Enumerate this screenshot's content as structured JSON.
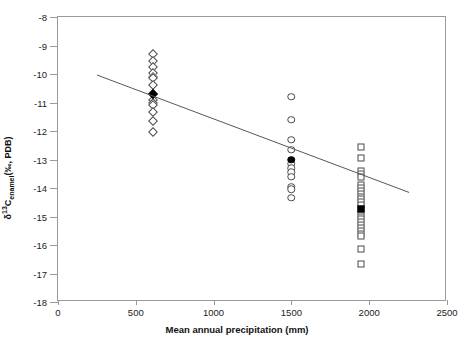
{
  "chart_data": {
    "type": "scatter",
    "title": "",
    "xlabel": "Mean annual precipitation (mm)",
    "ylabel": "d13C_enamel (per mil, PDB)",
    "ylabel_parts": {
      "delta": "δ",
      "sup": "13",
      "c": "C",
      "sub": "enamel",
      "units": "(‰, PDB)"
    },
    "xlim": [
      0,
      2500
    ],
    "ylim": [
      -18,
      -8
    ],
    "xticks": [
      0,
      500,
      1000,
      1500,
      2000,
      2500
    ],
    "yticks": [
      -8,
      -9,
      -10,
      -11,
      -12,
      -13,
      -14,
      -15,
      -16,
      -17,
      -18
    ],
    "xticklabels": [
      "0",
      "500",
      "1000",
      "1500",
      "2000",
      "2500"
    ],
    "yticklabels": [
      "-8",
      "-9",
      "-10",
      "-11",
      "-12",
      "-13",
      "-14",
      "-15",
      "-16",
      "-17",
      "-18"
    ],
    "grid": false,
    "legend": "none",
    "series": [
      {
        "name": "site-600mm",
        "marker": "diamond",
        "x": 610,
        "values": [
          -9.3,
          -9.55,
          -9.75,
          -9.95,
          -10.1,
          -10.15,
          -10.4,
          -10.9,
          -11.0,
          -11.1,
          -11.35,
          -11.65,
          -12.05
        ],
        "mean_marker": {
          "x": 610,
          "y": -10.7,
          "filled": true
        }
      },
      {
        "name": "site-1500mm",
        "marker": "circle",
        "x": 1500,
        "values": [
          -10.8,
          -11.6,
          -12.3,
          -12.65,
          -13.15,
          -13.3,
          -13.45,
          -13.6,
          -13.95,
          -14.05,
          -14.35
        ],
        "mean_marker": {
          "x": 1500,
          "y": -13.0,
          "filled": true
        }
      },
      {
        "name": "site-1950mm",
        "marker": "square",
        "x": 1950,
        "values": [
          -12.55,
          -12.95,
          -13.4,
          -13.5,
          -13.6,
          -13.9,
          -14.0,
          -14.1,
          -14.2,
          -14.3,
          -14.4,
          -14.5,
          -14.6,
          -14.9,
          -15.0,
          -15.1,
          -15.2,
          -15.3,
          -15.4,
          -15.5,
          -15.6,
          -15.7,
          -16.15,
          -16.65
        ],
        "mean_marker": {
          "x": 1950,
          "y": -14.75,
          "filled": true
        }
      }
    ],
    "regression_line": {
      "x_start": 250,
      "y_start": -10.05,
      "x_end": 2270,
      "y_end": -14.2,
      "color": "#555555"
    }
  }
}
